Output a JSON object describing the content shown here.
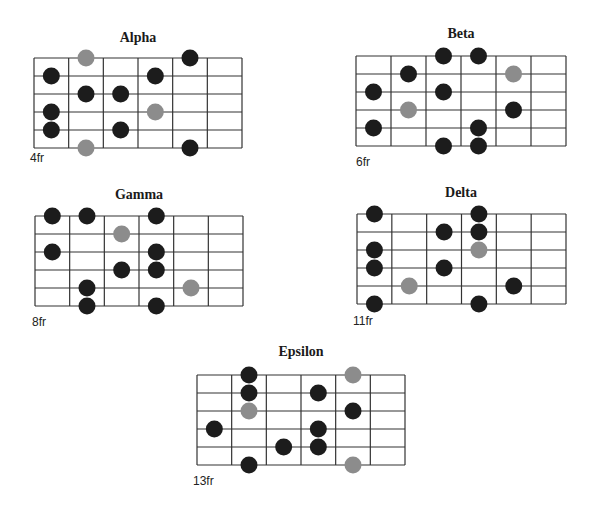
{
  "colors": {
    "root": "#8c8c8c",
    "note": "#1c1c1c",
    "line": "#333333"
  },
  "diagrams": [
    {
      "title": "Alpha",
      "fret_label": "4fr",
      "dots": [
        {
          "string": 0,
          "fret": 1,
          "type": "root"
        },
        {
          "string": 0,
          "fret": 4,
          "type": "note"
        },
        {
          "string": 1,
          "fret": 0,
          "type": "note"
        },
        {
          "string": 1,
          "fret": 3,
          "type": "note"
        },
        {
          "string": 2,
          "fret": 1,
          "type": "note"
        },
        {
          "string": 2,
          "fret": 2,
          "type": "note"
        },
        {
          "string": 3,
          "fret": 0,
          "type": "note"
        },
        {
          "string": 3,
          "fret": 3,
          "type": "root"
        },
        {
          "string": 4,
          "fret": 0,
          "type": "note"
        },
        {
          "string": 4,
          "fret": 2,
          "type": "note"
        },
        {
          "string": 5,
          "fret": 1,
          "type": "root"
        },
        {
          "string": 5,
          "fret": 4,
          "type": "note"
        }
      ]
    },
    {
      "title": "Beta",
      "fret_label": "6fr",
      "dots": [
        {
          "string": 0,
          "fret": 2,
          "type": "note"
        },
        {
          "string": 0,
          "fret": 3,
          "type": "note"
        },
        {
          "string": 1,
          "fret": 1,
          "type": "note"
        },
        {
          "string": 1,
          "fret": 4,
          "type": "root"
        },
        {
          "string": 2,
          "fret": 0,
          "type": "note"
        },
        {
          "string": 2,
          "fret": 2,
          "type": "note"
        },
        {
          "string": 3,
          "fret": 1,
          "type": "root"
        },
        {
          "string": 3,
          "fret": 4,
          "type": "note"
        },
        {
          "string": 4,
          "fret": 0,
          "type": "note"
        },
        {
          "string": 4,
          "fret": 3,
          "type": "note"
        },
        {
          "string": 5,
          "fret": 2,
          "type": "note"
        },
        {
          "string": 5,
          "fret": 3,
          "type": "note"
        }
      ]
    },
    {
      "title": "Gamma",
      "fret_label": "8fr",
      "dots": [
        {
          "string": 0,
          "fret": 0,
          "type": "note"
        },
        {
          "string": 0,
          "fret": 1,
          "type": "note"
        },
        {
          "string": 0,
          "fret": 3,
          "type": "note"
        },
        {
          "string": 1,
          "fret": 2,
          "type": "root"
        },
        {
          "string": 2,
          "fret": 0,
          "type": "note"
        },
        {
          "string": 2,
          "fret": 3,
          "type": "note"
        },
        {
          "string": 3,
          "fret": 2,
          "type": "note"
        },
        {
          "string": 3,
          "fret": 3,
          "type": "note"
        },
        {
          "string": 4,
          "fret": 1,
          "type": "note"
        },
        {
          "string": 4,
          "fret": 4,
          "type": "root"
        },
        {
          "string": 5,
          "fret": 1,
          "type": "note"
        },
        {
          "string": 5,
          "fret": 3,
          "type": "note"
        }
      ]
    },
    {
      "title": "Delta",
      "fret_label": "11fr",
      "dots": [
        {
          "string": 0,
          "fret": 0,
          "type": "note"
        },
        {
          "string": 0,
          "fret": 3,
          "type": "note"
        },
        {
          "string": 1,
          "fret": 2,
          "type": "note"
        },
        {
          "string": 1,
          "fret": 3,
          "type": "note"
        },
        {
          "string": 2,
          "fret": 0,
          "type": "note"
        },
        {
          "string": 2,
          "fret": 3,
          "type": "root"
        },
        {
          "string": 3,
          "fret": 0,
          "type": "note"
        },
        {
          "string": 3,
          "fret": 2,
          "type": "note"
        },
        {
          "string": 4,
          "fret": 1,
          "type": "root"
        },
        {
          "string": 4,
          "fret": 4,
          "type": "note"
        },
        {
          "string": 5,
          "fret": 0,
          "type": "note"
        },
        {
          "string": 5,
          "fret": 3,
          "type": "note"
        }
      ]
    },
    {
      "title": "Epsilon",
      "fret_label": "13fr",
      "dots": [
        {
          "string": 0,
          "fret": 1,
          "type": "note"
        },
        {
          "string": 0,
          "fret": 4,
          "type": "root"
        },
        {
          "string": 1,
          "fret": 1,
          "type": "note"
        },
        {
          "string": 1,
          "fret": 3,
          "type": "note"
        },
        {
          "string": 2,
          "fret": 1,
          "type": "root"
        },
        {
          "string": 2,
          "fret": 4,
          "type": "note"
        },
        {
          "string": 3,
          "fret": 0,
          "type": "note"
        },
        {
          "string": 3,
          "fret": 3,
          "type": "note"
        },
        {
          "string": 4,
          "fret": 2,
          "type": "note"
        },
        {
          "string": 4,
          "fret": 3,
          "type": "note"
        },
        {
          "string": 5,
          "fret": 1,
          "type": "note"
        },
        {
          "string": 5,
          "fret": 4,
          "type": "root"
        }
      ]
    }
  ]
}
